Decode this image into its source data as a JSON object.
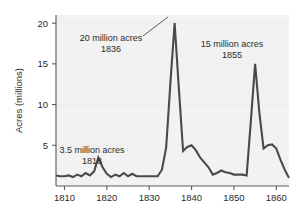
{
  "chart_data": {
    "type": "line",
    "title": "",
    "xlabel": "",
    "ylabel": "Acres (millions)",
    "xlim": [
      1808,
      1863
    ],
    "ylim": [
      0,
      21
    ],
    "grid": true,
    "legend": "none",
    "x_ticks": [
      1810,
      1820,
      1830,
      1840,
      1850,
      1860
    ],
    "y_ticks": [
      5,
      10,
      15,
      20
    ],
    "series_name": "Federal land sales",
    "x": [
      1808,
      1809,
      1810,
      1811,
      1812,
      1813,
      1814,
      1815,
      1816,
      1817,
      1818,
      1819,
      1820,
      1821,
      1822,
      1823,
      1824,
      1825,
      1826,
      1827,
      1828,
      1829,
      1830,
      1831,
      1832,
      1833,
      1834,
      1835,
      1836,
      1837,
      1838,
      1839,
      1840,
      1841,
      1842,
      1843,
      1844,
      1845,
      1846,
      1847,
      1848,
      1849,
      1850,
      1851,
      1852,
      1853,
      1854,
      1855,
      1856,
      1857,
      1858,
      1859,
      1860,
      1861,
      1862,
      1863
    ],
    "values": [
      1.3,
      1.2,
      1.2,
      1.3,
      1.1,
      1.4,
      1.2,
      1.6,
      1.3,
      1.8,
      3.5,
      2.3,
      1.5,
      1.1,
      1.4,
      1.2,
      1.6,
      1.2,
      1.5,
      1.2,
      1.2,
      1.2,
      1.2,
      1.2,
      1.2,
      2.0,
      4.7,
      12.6,
      20.0,
      12.0,
      4.3,
      4.8,
      5.0,
      4.4,
      3.5,
      2.9,
      2.3,
      1.4,
      1.6,
      1.9,
      1.7,
      1.6,
      1.4,
      1.4,
      1.4,
      1.3,
      8.0,
      15.0,
      9.0,
      4.6,
      5.0,
      5.1,
      4.6,
      3.2,
      2.0,
      1.0
    ],
    "annotations": [
      {
        "id": "peak-1836",
        "line1": "20 million acres",
        "line2": "1836",
        "value": 20.0,
        "year": 1836,
        "has_leader": true
      },
      {
        "id": "peak-1855",
        "line1": "15 million acres",
        "line2": "1855",
        "value": 15.0,
        "year": 1855,
        "has_leader": false
      },
      {
        "id": "peak-1818",
        "line1": "3.5 million acres",
        "line2": "1818",
        "value": 3.5,
        "year": 1818,
        "has_leader": false
      }
    ],
    "colors": {
      "line": "#4a4a4a",
      "plot_background": "#f2f2f2",
      "axis": "#5a5a5a",
      "text": "#2b2b2b",
      "grid": "#e8e8e8"
    }
  }
}
